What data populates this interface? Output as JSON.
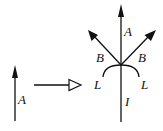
{
  "diagram": {
    "left_arrow": {
      "label": "A"
    },
    "transition_arrow": {
      "style": "hollow-head"
    },
    "result": {
      "up_label": "A",
      "left_branch_label": "B",
      "right_branch_label": "B",
      "arc_left_label": "L",
      "arc_right_label": "L",
      "stem_label": "I"
    },
    "colors": {
      "stroke": "#111111",
      "background": "#ffffff"
    }
  }
}
